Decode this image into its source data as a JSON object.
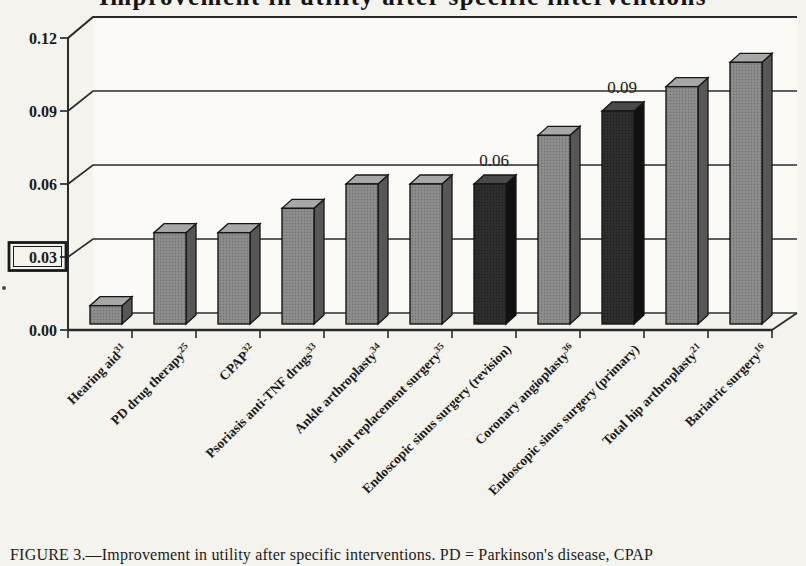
{
  "figure": {
    "title": "Improvement in utility after specific interventions",
    "caption": "FIGURE 3.—Improvement in utility after specific interventions. PD = Parkinson's disease, CPAP"
  },
  "chart_data": {
    "type": "bar",
    "style": "3d-column",
    "title": "Improvement in utility after specific interventions",
    "xlabel": "",
    "ylabel": "",
    "ylim": [
      0,
      0.12
    ],
    "ytick_step": 0.03,
    "yticks": [
      "0.00",
      "0.03",
      "0.06",
      "0.09",
      "0.12"
    ],
    "boxed_ytick": "0.03",
    "grid": true,
    "legend": false,
    "bars": [
      {
        "label": "Hearing aid",
        "ref": "31",
        "value": 0.01,
        "shade": "gray",
        "value_label": ""
      },
      {
        "label": "PD drug therapy",
        "ref": "25",
        "value": 0.04,
        "shade": "gray",
        "value_label": ""
      },
      {
        "label": "CPAP",
        "ref": "32",
        "value": 0.04,
        "shade": "gray",
        "value_label": ""
      },
      {
        "label": "Psoriasis anti-TNF drugs",
        "ref": "33",
        "value": 0.05,
        "shade": "gray",
        "value_label": ""
      },
      {
        "label": "Ankle arthroplasty",
        "ref": "34",
        "value": 0.06,
        "shade": "gray",
        "value_label": ""
      },
      {
        "label": "Joint replacement surgery",
        "ref": "35",
        "value": 0.06,
        "shade": "gray",
        "value_label": ""
      },
      {
        "label": "Endoscopic sinus surgery (revision)",
        "ref": "",
        "value": 0.06,
        "shade": "dark",
        "value_label": "0.06"
      },
      {
        "label": "Coronary angioplasty",
        "ref": "36",
        "value": 0.08,
        "shade": "gray",
        "value_label": ""
      },
      {
        "label": "Endoscopic sinus surgery (primary)",
        "ref": "",
        "value": 0.09,
        "shade": "dark",
        "value_label": "0.09"
      },
      {
        "label": "Total hip arthroplasty",
        "ref": "21",
        "value": 0.1,
        "shade": "gray",
        "value_label": ""
      },
      {
        "label": "Bariatric surgery",
        "ref": "16",
        "value": 0.11,
        "shade": "gray",
        "value_label": ""
      }
    ]
  },
  "colors": {
    "gray_bar_front": "#8d8d8d",
    "gray_bar_top": "#a7a7a7",
    "gray_bar_side": "#575757",
    "gray_bar_dot": "#6f6f6f",
    "dark_bar_front": "#2e2e2e",
    "dark_bar_top": "#4a4a4a",
    "dark_bar_side": "#111111",
    "dark_bar_dot": "#1c1c1c",
    "line": "#2b2b2b",
    "outline": "#161616",
    "background": "#f4f3ee",
    "wall": "#fbfaf6",
    "floor": "#f3f2ec",
    "text": "#1a1a1a"
  }
}
